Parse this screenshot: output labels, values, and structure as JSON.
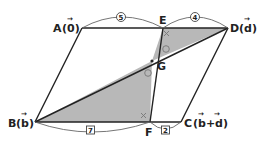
{
  "diagram": {
    "type": "geometry-parallelogram",
    "colors": {
      "line": "#222222",
      "shade": "#b8b8b8",
      "arc": "#666666",
      "background": "#ffffff"
    },
    "points": {
      "A": {
        "label": "A(0⃗)",
        "name": "A",
        "vector": "0",
        "x": 82,
        "y": 28
      },
      "D": {
        "label": "D(d⃗)",
        "name": "D",
        "vector": "d",
        "x": 228,
        "y": 28
      },
      "B": {
        "label": "B(b⃗)",
        "name": "B",
        "vector": "b",
        "x": 35,
        "y": 122
      },
      "C": {
        "label": "C(b⃗+d⃗)",
        "name": "C",
        "vector": "b+d",
        "x": 181,
        "y": 122
      },
      "E": {
        "label": "E",
        "x": 163,
        "y": 28
      },
      "F": {
        "label": "F",
        "x": 150,
        "y": 122
      },
      "G": {
        "label": "G",
        "x": 152,
        "y": 61
      }
    },
    "labels": {
      "A_name": "A",
      "A_vec": "(0)",
      "D_name": "D",
      "D_vec": "(d)",
      "B_name": "B",
      "B_vec": "(b)",
      "C_name": "C",
      "C_vec": "(b+d)",
      "E": "E",
      "F": "F",
      "G": "G"
    },
    "ratios": {
      "AE": {
        "value": "5",
        "style": "circled"
      },
      "ED": {
        "value": "4",
        "style": "circled"
      },
      "BF": {
        "value": "7",
        "style": "boxed"
      },
      "FC": {
        "value": "2",
        "style": "boxed"
      }
    },
    "angle_marks": [
      {
        "at": "E",
        "mark": "×"
      },
      {
        "at": "F",
        "mark": "×"
      },
      {
        "at": "G-upper",
        "mark": "○"
      },
      {
        "at": "G-lower",
        "mark": "○"
      }
    ],
    "shaded_regions": [
      "triangle EGD",
      "triangle BGF"
    ],
    "segments": [
      "AD",
      "BC",
      "AB",
      "DC",
      "EF",
      "BD"
    ]
  }
}
